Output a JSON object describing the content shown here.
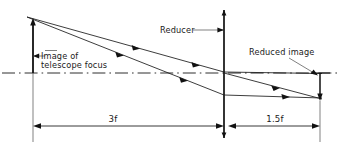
{
  "diagram": {
    "type": "optical-ray-diagram",
    "background_color": "#ffffff",
    "line_color": "#111111",
    "axis_color": "#333333",
    "labels": {
      "object_label_line1": "Image of",
      "object_label_line2": "telescope focus",
      "lens_label": "Reducer",
      "image_label": "Reduced image",
      "dimension_left": "3f",
      "dimension_right": "1.5f"
    },
    "elements": [
      {
        "name": "optical-axis",
        "style": "dash-dot",
        "y": 73
      },
      {
        "name": "object-arrow",
        "x": 33,
        "from_y": 73,
        "to_y": 21,
        "direction": "up"
      },
      {
        "name": "reducer-lens",
        "x": 224,
        "from_y": 10,
        "to_y": 138
      },
      {
        "name": "image-arrow",
        "x": 320,
        "from_y": 73,
        "to_y": 101,
        "direction": "down"
      },
      {
        "name": "ray-upper",
        "from": "33,21",
        "to": "320,73"
      },
      {
        "name": "ray-lower",
        "from": "33,21",
        "to": "224,94"
      },
      {
        "name": "ray-lower-out",
        "from": "224,94",
        "to": "320,101"
      },
      {
        "name": "ray-cross",
        "from": "224,73",
        "to": "320,101"
      }
    ],
    "dimensions": [
      {
        "name": "dimension-3f",
        "label": "3f",
        "x_start": 33,
        "x_end": 224,
        "y": 126
      },
      {
        "name": "dimension-1p5f",
        "label": "1.5f",
        "x_start": 228,
        "x_end": 320,
        "y": 126
      }
    ]
  }
}
